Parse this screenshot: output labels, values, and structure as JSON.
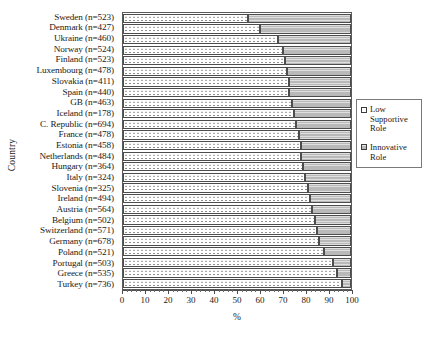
{
  "chart_data": {
    "type": "bar",
    "orientation": "horizontal",
    "stacked": true,
    "title": "",
    "xlabel": "%",
    "ylabel": "Country",
    "xlim": [
      0,
      100
    ],
    "xticks": [
      0,
      10,
      20,
      30,
      40,
      50,
      60,
      70,
      80,
      90,
      100
    ],
    "xtick_labels": [
      "0",
      "10",
      "20",
      "30",
      "40",
      "50",
      "60",
      "70",
      "80",
      "90",
      "100"
    ],
    "grid": false,
    "legend_position": "right",
    "legend": [
      "Low Supportive Role",
      "Innovative Role"
    ],
    "categories": [
      "Sweden (n=523)",
      "Denmark (n=427)",
      "Ukraine (n=460)",
      "Norway (n=524)",
      "Finland (n=523)",
      "Luxembourg (n=478)",
      "Slovakia (n=411)",
      "Spain (n=440)",
      "GB (n=463)",
      "Iceland (n=178)",
      "C. Republic (n=694)",
      "France (n=478)",
      "Estonia (n=458)",
      "Netherlands (n=484)",
      "Hungary (n=364)",
      "Italy (n=324)",
      "Slovenia (n=325)",
      "Ireland (n=494)",
      "Austria (n=564)",
      "Belgium (n=502)",
      "Switzerland (n=571)",
      "Germany (n=678)",
      "Poland (n=521)",
      "Portugal (n=503)",
      "Greece (n=535)",
      "Turkey (n=736)"
    ],
    "series": [
      {
        "name": "Low Supportive Role",
        "color": "#ffffff",
        "values": [
          55,
          60,
          68,
          70,
          71,
          72,
          73,
          73,
          74,
          75,
          76,
          77,
          78,
          78,
          79,
          80,
          81,
          82,
          83,
          84,
          85,
          86,
          88,
          92,
          94,
          96
        ]
      },
      {
        "name": "Innovative Role",
        "color": "#b9b9b9",
        "values": [
          45,
          40,
          32,
          30,
          29,
          28,
          27,
          27,
          26,
          25,
          24,
          23,
          22,
          22,
          21,
          20,
          19,
          18,
          17,
          16,
          15,
          14,
          12,
          8,
          6,
          4
        ]
      }
    ]
  },
  "legend": {
    "items": [
      {
        "label": "Low Supportive Role",
        "swatch": "low-supportive-swatch"
      },
      {
        "label": "Innovative Role",
        "swatch": "innovative-swatch"
      }
    ]
  },
  "axes": {
    "x_title": "%",
    "y_title": "Country"
  }
}
